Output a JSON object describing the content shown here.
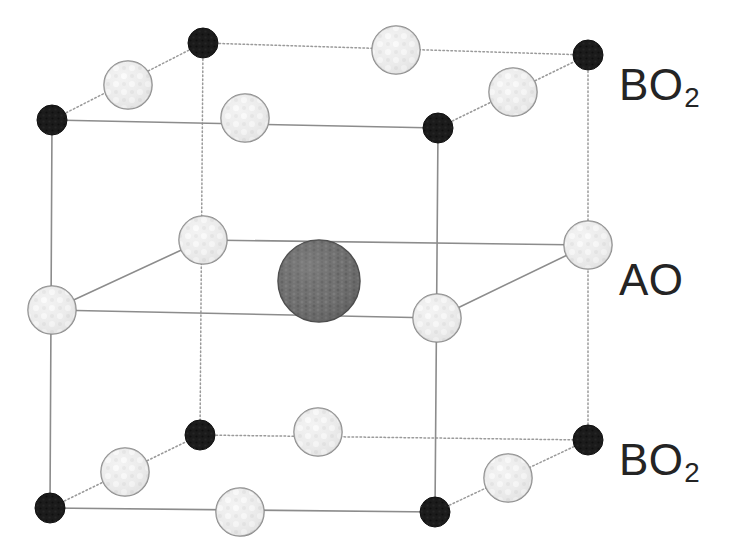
{
  "figure": {
    "background_color": "#ffffff"
  },
  "labels": [
    {
      "id": "bo2-top",
      "base": "BO",
      "sub": "2",
      "x": 619,
      "y": 63
    },
    {
      "id": "ao",
      "base": "AO",
      "sub": "",
      "x": 619,
      "y": 258
    },
    {
      "id": "bo2-bot",
      "base": "BO",
      "sub": "2",
      "x": 619,
      "y": 438
    }
  ],
  "structure": {
    "type": "cubic-unit-cell",
    "projection": "oblique",
    "vertices": {
      "front_top_left": [
        52,
        120
      ],
      "front_top_right": [
        438,
        128
      ],
      "back_top_left": [
        203,
        43
      ],
      "back_top_right": [
        588,
        55
      ],
      "front_bot_left": [
        50,
        508
      ],
      "front_bot_right": [
        435,
        512
      ],
      "back_bot_left": [
        200,
        435
      ],
      "back_bot_right": [
        588,
        440
      ]
    },
    "edge_color": "#8c8c8c",
    "edge_width": 1.6,
    "hidden_edge_style": "dotted",
    "atoms": {
      "B": {
        "label": "B",
        "color": "#1c1c1c",
        "radius": 15,
        "stroke": "#101010",
        "positions": [
          [
            52,
            120
          ],
          [
            438,
            128
          ],
          [
            203,
            43
          ],
          [
            588,
            55
          ],
          [
            50,
            508
          ],
          [
            435,
            512
          ],
          [
            200,
            435
          ],
          [
            588,
            440
          ]
        ]
      },
      "O": {
        "label": "O",
        "color": "#e3e3e3",
        "radius": 24,
        "stroke": "#8a8a8a",
        "positions": [
          [
            128,
            85
          ],
          [
            245,
            118
          ],
          [
            396,
            50
          ],
          [
            513,
            92
          ],
          [
            52,
            310
          ],
          [
            203,
            240
          ],
          [
            437,
            318
          ],
          [
            588,
            245
          ],
          [
            125,
            472
          ],
          [
            240,
            512
          ],
          [
            318,
            432
          ],
          [
            508,
            478
          ]
        ]
      },
      "A": {
        "label": "A",
        "color": "#6e6e6e",
        "radius": 41,
        "stroke": "#4a4a4a",
        "positions": [
          [
            319,
            281
          ]
        ]
      }
    }
  }
}
